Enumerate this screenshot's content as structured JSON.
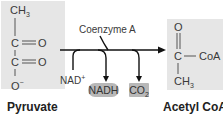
{
  "pyruvate": {
    "label": "Pyruvate",
    "atoms": {
      "ch3": "CH",
      "ch3_sub": "3",
      "c1": "C",
      "o1": "O",
      "c2": "C",
      "o2": "O",
      "o3": "O",
      "o3_sup": "−"
    }
  },
  "acetyl_coa": {
    "label": "Acetyl CoA",
    "atoms": {
      "o": "O",
      "c": "C",
      "coa": "CoA",
      "ch3": "CH",
      "ch3_sub": "3"
    }
  },
  "reaction": {
    "cofactor_in": "Coenzyme A",
    "nad": "NAD",
    "nad_sup": "+",
    "nadh": "NADH",
    "co2": "CO",
    "co2_sub": "2"
  },
  "colors": {
    "box_bg": "#e6e6e6",
    "pill_bg": "#b8b8b8",
    "arrow": "#111111"
  }
}
